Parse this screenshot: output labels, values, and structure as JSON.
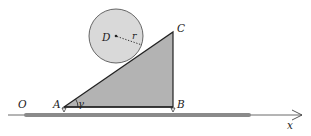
{
  "diagram": {
    "labels": {
      "origin": "O",
      "point_a": "A",
      "point_b": "B",
      "point_c": "C",
      "center_d": "D",
      "radius": "r",
      "angle": "γ",
      "axis_x": "x"
    },
    "colors": {
      "circle_fill": "#d9d9d9",
      "triangle_fill": "#b3b3b3",
      "ground_bar": "#8a8a8a",
      "stroke": "#222222"
    }
  }
}
